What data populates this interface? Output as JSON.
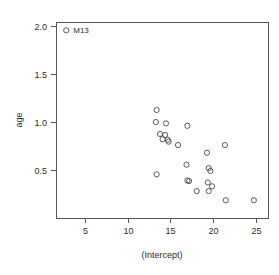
{
  "chart_data": {
    "type": "scatter",
    "title": "",
    "xlabel": "(Intercept)",
    "ylabel": "age",
    "xlim": [
      2.2,
      27.1
    ],
    "ylim": [
      0.12,
      2.02
    ],
    "xticks": [
      5,
      10,
      15,
      20,
      25
    ],
    "xticklabels": [
      "5",
      "10",
      "15",
      "20",
      "25"
    ],
    "yticks": [
      0.5,
      1.0,
      1.5,
      2.0
    ],
    "yticklabels": [
      "0.5",
      "1.0",
      "1.5",
      "2.0"
    ],
    "grid": false,
    "legend": null,
    "marker": "open-circle",
    "points": [
      {
        "x": 2.8,
        "y": 1.955,
        "label": "M13"
      },
      {
        "x": 13.4,
        "y": 1.125,
        "label": ""
      },
      {
        "x": 13.3,
        "y": 1.0,
        "label": ""
      },
      {
        "x": 14.5,
        "y": 0.985,
        "label": ""
      },
      {
        "x": 17.0,
        "y": 0.96,
        "label": ""
      },
      {
        "x": 13.8,
        "y": 0.875,
        "label": ""
      },
      {
        "x": 14.4,
        "y": 0.865,
        "label": ""
      },
      {
        "x": 14.1,
        "y": 0.82,
        "label": ""
      },
      {
        "x": 14.7,
        "y": 0.815,
        "label": ""
      },
      {
        "x": 14.8,
        "y": 0.795,
        "label": ""
      },
      {
        "x": 15.9,
        "y": 0.76,
        "label": ""
      },
      {
        "x": 21.4,
        "y": 0.76,
        "label": ""
      },
      {
        "x": 19.3,
        "y": 0.68,
        "label": ""
      },
      {
        "x": 16.9,
        "y": 0.555,
        "label": ""
      },
      {
        "x": 19.5,
        "y": 0.52,
        "label": ""
      },
      {
        "x": 19.7,
        "y": 0.49,
        "label": ""
      },
      {
        "x": 13.4,
        "y": 0.455,
        "label": ""
      },
      {
        "x": 17.0,
        "y": 0.39,
        "label": ""
      },
      {
        "x": 17.2,
        "y": 0.385,
        "label": ""
      },
      {
        "x": 19.4,
        "y": 0.37,
        "label": ""
      },
      {
        "x": 19.9,
        "y": 0.33,
        "label": ""
      },
      {
        "x": 18.1,
        "y": 0.28,
        "label": ""
      },
      {
        "x": 19.5,
        "y": 0.28,
        "label": ""
      },
      {
        "x": 21.5,
        "y": 0.185,
        "label": ""
      },
      {
        "x": 24.8,
        "y": 0.185,
        "label": ""
      }
    ],
    "annotations": [
      {
        "text": "M13",
        "x": 2.8,
        "y": 1.955,
        "position": "right"
      }
    ],
    "colors": {
      "marker_stroke": "#4a4a4a",
      "axis": "#555555",
      "text": "#2b2b2b",
      "background": "#ffffff"
    },
    "geometry": {
      "plot_left_px": 56,
      "plot_right_px": 268,
      "plot_top_px": 22,
      "plot_bottom_px": 218,
      "x_origin_px": 85,
      "x_scale_px_per_unit": 8.53,
      "y_origin_px": 170,
      "y_scale_px_per_unit": 96,
      "marker_radius_px": 2.6
    }
  }
}
